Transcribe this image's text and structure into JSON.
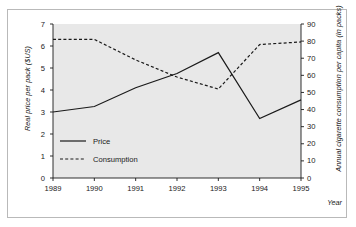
{
  "figure": {
    "background_color": "#ffffff",
    "border_color": "#b9b9b9",
    "plot_background_color": "#e8e8e8",
    "axis_color": "#1a1a1a",
    "series_color": "#1a1a1a"
  },
  "chart_data": {
    "type": "line",
    "title": "",
    "subtitle": "",
    "xlabel": "Year",
    "ylabel": "Real price per pack ($US)",
    "y2label": "Annual cigarette consumption per capita (in packs)",
    "categories": [
      "1989",
      "1990",
      "1991",
      "1992",
      "1993",
      "1994",
      "1995"
    ],
    "x": [
      1989,
      1990,
      1991,
      1992,
      1993,
      1994,
      1995
    ],
    "xlim": [
      1989,
      1995
    ],
    "ylim": [
      0,
      7
    ],
    "y2lim": [
      0,
      90
    ],
    "yticks": [
      "0",
      "1",
      "2",
      "3",
      "4",
      "5",
      "6",
      "7"
    ],
    "ytick_values": [
      0,
      1,
      2,
      3,
      4,
      5,
      6,
      7
    ],
    "y2ticks": [
      "0",
      "10",
      "20",
      "30",
      "40",
      "50",
      "60",
      "70",
      "80",
      "90"
    ],
    "y2tick_values": [
      0,
      10,
      20,
      30,
      40,
      50,
      60,
      70,
      80,
      90
    ],
    "grid": false,
    "legend_position": "inside-lower-left",
    "series": [
      {
        "name": "Price",
        "axis": "left",
        "style": "solid",
        "values": [
          3.0,
          3.25,
          4.1,
          4.75,
          5.7,
          2.7,
          3.55
        ]
      },
      {
        "name": "Consumption",
        "axis": "right",
        "style": "dashed",
        "values": [
          81,
          81,
          69,
          59,
          52,
          78,
          79.5
        ]
      }
    ]
  },
  "legend": {
    "items": [
      {
        "label": "Price",
        "style": "solid"
      },
      {
        "label": "Consumption",
        "style": "dashed"
      }
    ]
  }
}
